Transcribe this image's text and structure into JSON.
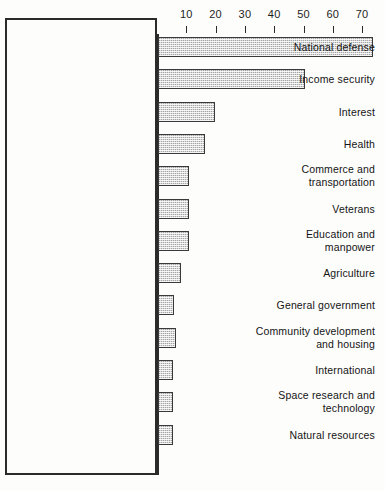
{
  "chart_data": {
    "type": "bar",
    "orientation": "horizontal",
    "title": "",
    "subtitle": "",
    "xlabel": "",
    "ylabel": "",
    "xlim": [
      0,
      75
    ],
    "grid": false,
    "legend": null,
    "axis": {
      "position": "top",
      "tick_labels": [
        "10",
        "20",
        "30",
        "40",
        "50",
        "60",
        "70"
      ],
      "tick_values": [
        10,
        20,
        30,
        40,
        50,
        60,
        70
      ]
    },
    "categories": [
      "National defense",
      "Income security",
      "Interest",
      "Health",
      "Commerce and\ntransportation",
      "Veterans",
      "Education and\nmanpower",
      "Agriculture",
      "General government",
      "Community development\nand housing",
      "International",
      "Space research and\ntechnology",
      "Natural resources"
    ],
    "values": [
      73.5,
      50.0,
      19.5,
      16.0,
      10.5,
      10.5,
      10.5,
      8.0,
      5.5,
      6.0,
      5.0,
      5.0,
      5.0
    ]
  },
  "style": {
    "bar_fill": "#d9d9d9",
    "bar_border": "#3a3a3a",
    "axis_color": "#2b2b2b",
    "text_color": "#141414",
    "background": "#fdfdfc"
  }
}
